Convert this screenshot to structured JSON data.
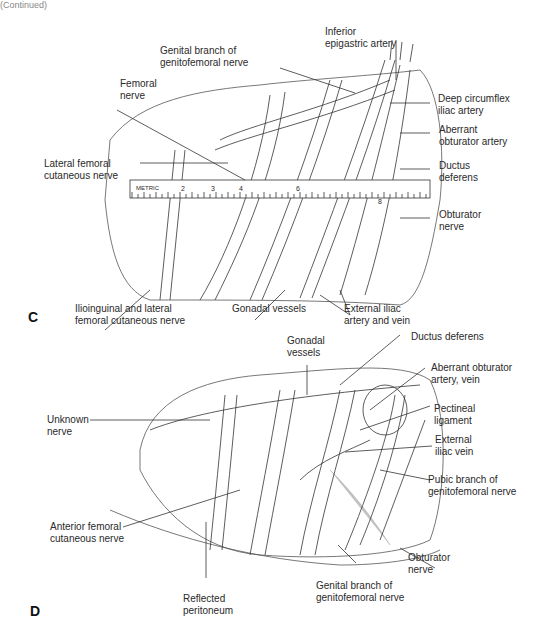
{
  "header": {
    "text": "(Continued)"
  },
  "panels": [
    {
      "letter": "C",
      "labels": {
        "genital_branch": "Genital branch of\ngenitofemoral nerve",
        "inferior_epigastric": "Inferior\nepigastric artery",
        "femoral_nerve": "Femoral\nnerve",
        "deep_circumflex": "Deep circumflex\niliac artery",
        "aberrant_obturator_artery": "Aberrant\nobturator artery",
        "lateral_femoral": "Lateral femoral\ncutaneous nerve",
        "ductus_deferens": "Ductus\ndeferens",
        "obturator_nerve": "Obturator\nnerve",
        "ilioinguinal": "Ilioinguinal and lateral\nfemoral cutaneous nerve",
        "gonadal_vessels": "Gonadal vessels",
        "external_iliac": "External iliac\nartery and vein"
      },
      "ruler": {
        "label": "METRIC",
        "ticks": [
          "2",
          "3",
          "4",
          "6",
          "8"
        ]
      }
    },
    {
      "letter": "D",
      "labels": {
        "gonadal_vessels": "Gonadal\nvessels",
        "ductus_deferens": "Ductus deferens",
        "aberrant_obturator": "Aberrant obturator\nartery, vein",
        "pectineal_ligament": "Pectineal\nligament",
        "unknown_nerve": "Unknown\nnerve",
        "external_iliac_vein": "External\niliac vein",
        "pubic_branch": "Pubic branch of\ngenitofemoral nerve",
        "anterior_femoral": "Anterior femoral\ncutaneous nerve",
        "obturator_nerve": "Obturator\nnerve",
        "genital_branch": "Genital branch of\ngenitofemoral nerve",
        "reflected_peritoneum": "Reflected\nperitoneum"
      }
    }
  ]
}
